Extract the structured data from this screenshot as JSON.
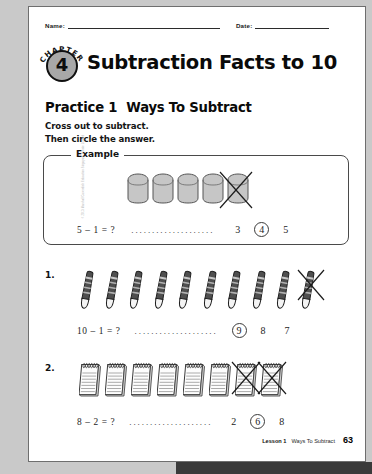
{
  "worksheet": {
    "name_label": "Name:",
    "date_label": "Date:",
    "chapter_word": "CHAPTER",
    "chapter_number": "4",
    "chapter_title": "Subtraction Facts to 10",
    "practice_label": "Practice 1",
    "practice_title": "Ways To Subtract",
    "instruction_line_1": "Cross out to subtract.",
    "instruction_line_2": "Then circle the answer.",
    "example_label": "Example",
    "copyright": "© 2013 Marshall Cavendish Education Singapore Private Limited"
  },
  "example": {
    "number": "",
    "object_type": "cube",
    "object_count": 5,
    "crossed_out_count": 1,
    "equation": "5 – 1 = ?",
    "dots": "....................",
    "choices": [
      "3",
      "4",
      "5"
    ],
    "circled_choice": "4",
    "circled_index": 1
  },
  "questions": [
    {
      "number": "1.",
      "object_type": "crayon",
      "object_count": 10,
      "crossed_out_count": 1,
      "equation": "10 – 1 = ?",
      "dots": "....................",
      "choices": [
        "9",
        "8",
        "7"
      ],
      "circled_choice": "9",
      "circled_index": 0
    },
    {
      "number": "2.",
      "object_type": "notepad",
      "object_count": 8,
      "crossed_out_count": 2,
      "equation": "8 – 2 = ?",
      "dots": "....................",
      "choices": [
        "2",
        "6",
        "8"
      ],
      "circled_choice": "6",
      "circled_index": 1
    }
  ],
  "footer": {
    "lesson": "Lesson 1",
    "title": "Ways To Subtract",
    "page": "63"
  },
  "colors": {
    "page_background": "#ffffff",
    "outside_background": "#c9c9c9",
    "badge_fill": "#a8a8a8",
    "ink": "#0a0a0a",
    "cube_fill": "#c4c4c4",
    "crayon_fill": "#4d4d4d"
  }
}
